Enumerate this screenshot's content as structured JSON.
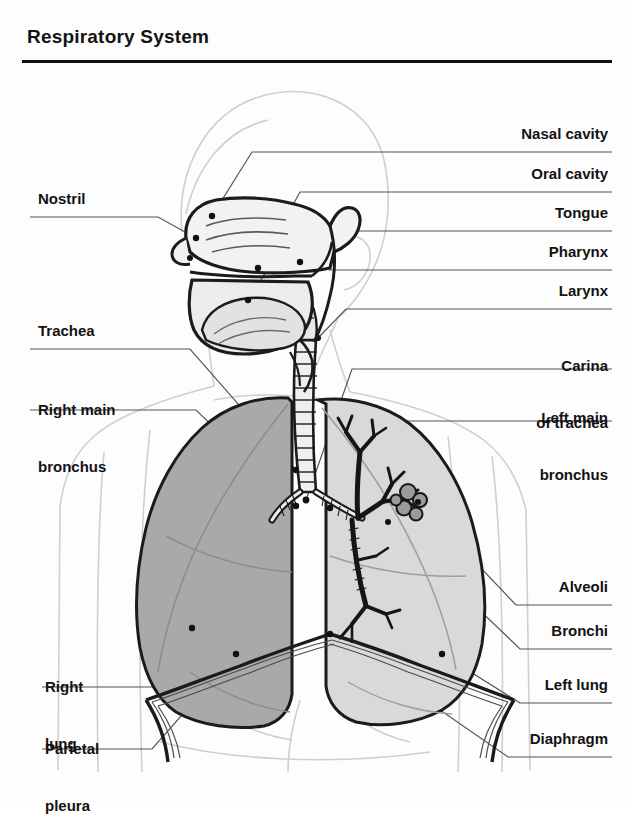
{
  "page": {
    "title": "Respiratory System",
    "background": "#fdfdfd",
    "ink": "#121212"
  },
  "colors": {
    "right_lung_fill": "#a9a9a9",
    "left_lung_fill": "#d9d9d9",
    "body_outline": "#cfcfcf",
    "anatomy_line": "#1b1b1b",
    "leader_line": "#555555",
    "alveoli_fill": "#9a9a9a"
  },
  "labels_right": [
    {
      "id": "nasal-cavity",
      "text": "Nasal cavity",
      "x": 608,
      "y": 133,
      "lines": [
        "Nasal cavity"
      ],
      "underline_y": 152,
      "underline_x1": 432,
      "underline_x2": 612
    },
    {
      "id": "oral-cavity",
      "text": "Oral cavity",
      "x": 608,
      "y": 173,
      "lines": [
        "Oral cavity"
      ],
      "underline_y": 192,
      "underline_x1": 432,
      "underline_x2": 612
    },
    {
      "id": "tongue",
      "text": "Tongue",
      "x": 608,
      "y": 212,
      "lines": [
        "Tongue"
      ],
      "underline_y": 231,
      "underline_x1": 432,
      "underline_x2": 612
    },
    {
      "id": "pharynx",
      "text": "Pharynx",
      "x": 608,
      "y": 251,
      "lines": [
        "Pharynx"
      ],
      "underline_y": 270,
      "underline_x1": 432,
      "underline_x2": 612
    },
    {
      "id": "larynx",
      "text": "Larynx",
      "x": 608,
      "y": 290,
      "lines": [
        "Larynx"
      ],
      "underline_y": 309,
      "underline_x1": 432,
      "underline_x2": 612
    },
    {
      "id": "carina-of-trachea",
      "text": "Carina of trachea",
      "x": 608,
      "y": 330,
      "lines": [
        "Carina",
        "of trachea"
      ],
      "underline_y": 369,
      "underline_x1": 432,
      "underline_x2": 612
    },
    {
      "id": "left-main-bronchus",
      "text": "Left main bronchus",
      "x": 608,
      "y": 382,
      "lines": [
        "Left main",
        "bronchus"
      ],
      "underline_y": 421,
      "underline_x1": 432,
      "underline_x2": 612
    },
    {
      "id": "alveoli",
      "text": "Alveoli",
      "x": 608,
      "y": 586,
      "lines": [
        "Alveoli"
      ],
      "underline_y": 605,
      "underline_x1": 510,
      "underline_x2": 612
    },
    {
      "id": "bronchi",
      "text": "Bronchi",
      "x": 608,
      "y": 630,
      "lines": [
        "Bronchi"
      ],
      "underline_y": 649,
      "underline_x1": 510,
      "underline_x2": 612
    },
    {
      "id": "left-lung",
      "text": "Left lung",
      "x": 608,
      "y": 684,
      "lines": [
        "Left lung"
      ],
      "underline_y": 703,
      "underline_x1": 510,
      "underline_x2": 612
    },
    {
      "id": "diaphragm",
      "text": "Diaphragm",
      "x": 608,
      "y": 738,
      "lines": [
        "Diaphragm"
      ],
      "underline_y": 757,
      "underline_x1": 510,
      "underline_x2": 612
    }
  ],
  "labels_left": [
    {
      "id": "nostril",
      "text": "Nostril",
      "x": 38,
      "y": 198,
      "lines": [
        "Nostril"
      ],
      "underline_y": 217,
      "underline_x1": 30,
      "underline_x2": 190
    },
    {
      "id": "trachea",
      "text": "Trachea",
      "x": 38,
      "y": 330,
      "lines": [
        "Trachea"
      ],
      "underline_y": 349,
      "underline_x1": 30,
      "underline_x2": 190
    },
    {
      "id": "right-main-bronchus",
      "text": "Right main bronchus",
      "x": 38,
      "y": 371,
      "lines": [
        "Right main",
        "bronchus"
      ],
      "underline_y": 410,
      "underline_x1": 30,
      "underline_x2": 190
    },
    {
      "id": "right-lung",
      "text": "Right lung",
      "x": 45,
      "y": 648,
      "lines": [
        "Right",
        "lung"
      ],
      "underline_y": 687,
      "underline_x1": 42,
      "underline_x2": 178
    },
    {
      "id": "parietal-pleura",
      "text": "Parietal pleura",
      "x": 45,
      "y": 710,
      "lines": [
        "Parietal",
        "pleura"
      ],
      "underline_y": 749,
      "underline_x1": 42,
      "underline_x2": 178
    }
  ],
  "diagram": {
    "name": "respiratory-system-anatomical-diagram",
    "view": "anterior thorax with midsagittal head section",
    "parts": [
      "body-silhouette",
      "head-section",
      "nasal-cavity",
      "oral-cavity",
      "tongue",
      "pharynx",
      "larynx",
      "trachea",
      "carina",
      "right-main-bronchus",
      "left-main-bronchus",
      "bronchial-tree",
      "alveoli-clusters",
      "right-lung",
      "left-lung",
      "diaphragm",
      "parietal-pleura"
    ]
  }
}
